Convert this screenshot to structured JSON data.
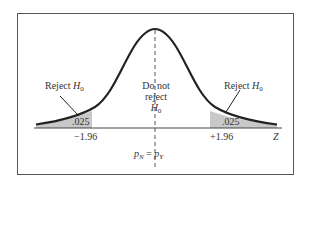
{
  "diagram": {
    "type": "two-tailed normal distribution hypothesis test",
    "left_region": {
      "label": "Reject",
      "hypothesis": "H",
      "subscript": "0",
      "area": ".025",
      "critical_value": "−1.96"
    },
    "center_region": {
      "line1": "Do not",
      "line2": "reject",
      "hypothesis": "H",
      "subscript": "0"
    },
    "right_region": {
      "label": "Reject",
      "hypothesis": "H",
      "subscript": "0",
      "area": ".025",
      "critical_value": "+1.96"
    },
    "axis_label": "Z",
    "center_label": {
      "left": "p",
      "left_sub": "N",
      "eq": " = ",
      "right": "p",
      "right_sub": "Y"
    },
    "colors": {
      "curve": "#222222",
      "shade": "#c8c8c8",
      "frame": "#555555",
      "axis": "#444444"
    }
  }
}
